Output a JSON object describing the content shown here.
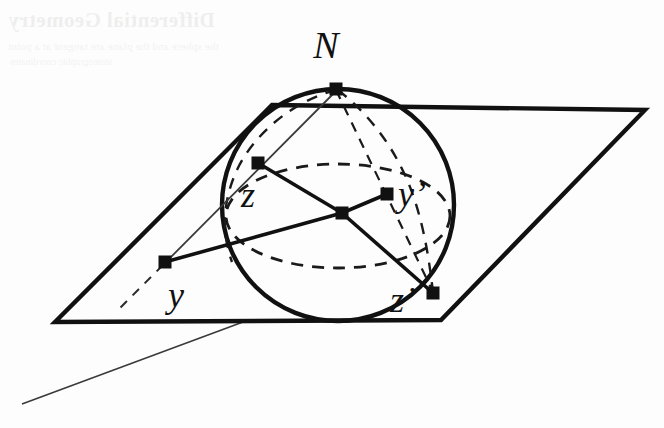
{
  "figure": {
    "caption": "",
    "background_color": "#fdfdfd",
    "ink_color": "#111111"
  },
  "bleed_through": {
    "visible": true,
    "title_text": "Differential Geometry",
    "body_text": "the sphere and the plane are tangent at a point",
    "body_text_2": "stereographic coordinates"
  },
  "labels": {
    "north_pole": "N",
    "point_z": "z",
    "point_y_prime": "y’",
    "point_y": "y",
    "point_z_prime": "z’"
  },
  "geometry": {
    "sphere": {
      "center_x": 338,
      "center_y": 205,
      "radius": 116,
      "stroke_width": 4.2
    },
    "equator_ellipse": {
      "center_x": 338,
      "center_y": 216,
      "rx": 112,
      "ry": 52,
      "dash": "11 9",
      "stroke_width": 2.6
    },
    "plane": {
      "shape": "parallelogram",
      "corner_top_left": [
        272,
        105
      ],
      "corner_top_right": [
        645,
        110
      ],
      "corner_bottom_right": [
        441,
        320
      ],
      "corner_bottom_left": [
        55,
        322
      ],
      "stroke_width": 4.4
    },
    "extension_line": {
      "from": [
        243,
        322
      ],
      "to": [
        22,
        404
      ],
      "stroke_width": 1.5
    },
    "points": {
      "N": [
        336,
        89
      ],
      "z": [
        258,
        163
      ],
      "y_prime": [
        387,
        194
      ],
      "center": [
        342,
        213
      ],
      "y": [
        165,
        262
      ],
      "z_prime": [
        433,
        293
      ]
    },
    "marker_size": 13,
    "radii_lines": [
      {
        "name": "center-to-z",
        "from": [
          342,
          213
        ],
        "to": [
          258,
          163
        ]
      },
      {
        "name": "center-to-y-prime",
        "from": [
          342,
          213
        ],
        "to": [
          387,
          194
        ]
      },
      {
        "name": "center-to-y",
        "from": [
          342,
          213
        ],
        "to": [
          165,
          262
        ]
      },
      {
        "name": "center-to-z-prime",
        "from": [
          342,
          213
        ],
        "to": [
          433,
          293
        ]
      }
    ],
    "projection_rays": [
      {
        "name": "ray-N-z-y",
        "style": "thin-solid",
        "from": [
          336,
          89
        ],
        "to": [
          165,
          262
        ]
      },
      {
        "name": "ray-N-yprime-zprime",
        "style": "dashed",
        "from": [
          336,
          89
        ],
        "to": [
          433,
          293
        ]
      },
      {
        "name": "ray-y-extension",
        "style": "dashed",
        "from": [
          165,
          262
        ],
        "to": [
          120,
          308
        ]
      }
    ]
  }
}
